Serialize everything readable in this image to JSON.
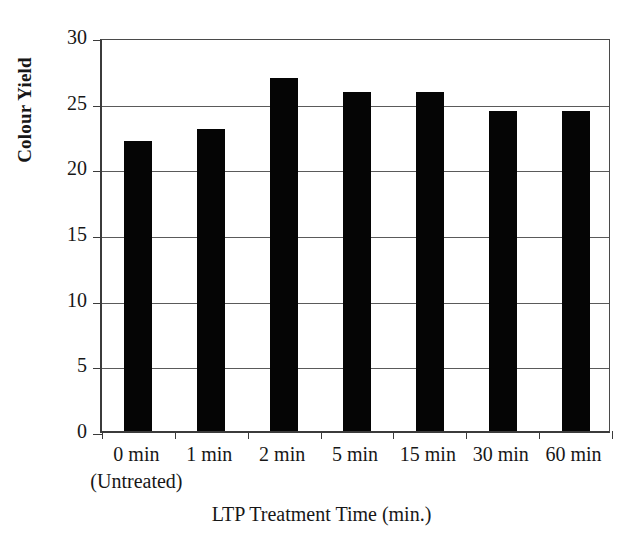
{
  "chart_data": {
    "type": "bar",
    "title": "",
    "xlabel": "LTP Treatment Time (min.)",
    "ylabel": "Colour Yield",
    "categories": [
      "0 min",
      "1 min",
      "2 min",
      "5 min",
      "15 min",
      "30 min",
      "60 min"
    ],
    "category_sublabels": [
      "(Untreated)",
      "",
      "",
      "",
      "",
      "",
      ""
    ],
    "values": [
      22.1,
      23.0,
      26.9,
      25.8,
      25.8,
      24.4,
      24.4
    ],
    "ylim": [
      0,
      30
    ],
    "yticks": [
      0,
      5,
      10,
      15,
      20,
      25,
      30
    ],
    "ytick_labels": [
      "0",
      "5",
      "10",
      "15",
      "20",
      "25",
      "30"
    ],
    "grid": true,
    "grid_axis": "y",
    "legend": null,
    "bar_color": "#050505",
    "axis_color": "#3b3b3b",
    "grid_color": "#5a5a5a",
    "background_color": "#ffffff"
  }
}
